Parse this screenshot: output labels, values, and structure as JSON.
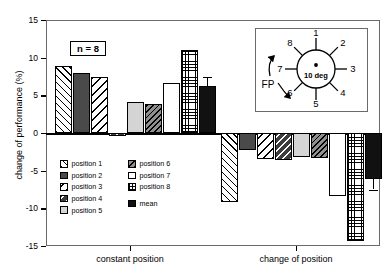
{
  "chart_data": {
    "type": "bar",
    "title": "",
    "xlabel": "",
    "ylabel": "change of performance (%)",
    "ylim": [
      -15,
      15
    ],
    "yticks": [
      15,
      10,
      5,
      0,
      -5,
      -10,
      -15
    ],
    "grid": false,
    "legend_position": "inside-lower-left",
    "annotation": "n = 8",
    "categories": [
      "constant position",
      "change of position"
    ],
    "series": [
      {
        "name": "position 1",
        "values": [
          8.9,
          -9.2
        ]
      },
      {
        "name": "position 2",
        "values": [
          7.9,
          -2.2
        ]
      },
      {
        "name": "position 3",
        "values": [
          7.4,
          -3.4
        ]
      },
      {
        "name": "position 4",
        "values": [
          -0.4,
          -3.6
        ]
      },
      {
        "name": "position 5",
        "values": [
          4.1,
          -3.2
        ]
      },
      {
        "name": "position 6",
        "values": [
          3.9,
          -3.3
        ]
      },
      {
        "name": "position 7",
        "values": [
          6.7,
          -8.4
        ]
      },
      {
        "name": "position 8",
        "values": [
          11.0,
          -14.3
        ]
      },
      {
        "name": "mean",
        "values": [
          6.2,
          -6.1
        ],
        "errors": [
          1.3,
          1.4
        ]
      }
    ]
  },
  "axes": {
    "ylabel": "change of performance (%)",
    "ytick_labels": [
      "15",
      "10",
      "5",
      "0",
      "-5",
      "-10",
      "-15"
    ],
    "xtick_labels": [
      "constant position",
      "change of position"
    ]
  },
  "annotation": {
    "n_label": "n = 8"
  },
  "legend": {
    "column_left": [
      {
        "label": "position 1",
        "pattern": "p1"
      },
      {
        "label": "position 2",
        "pattern": "p2"
      },
      {
        "label": "position 3",
        "pattern": "p3"
      },
      {
        "label": "position 4",
        "pattern": "p4"
      },
      {
        "label": "position 5",
        "pattern": "p5"
      }
    ],
    "column_right": [
      {
        "label": "position 6",
        "pattern": "p6"
      },
      {
        "label": "position 7",
        "pattern": "p7"
      },
      {
        "label": "position 8",
        "pattern": "p8"
      },
      {
        "label": "mean",
        "pattern": "pm"
      }
    ]
  },
  "inset": {
    "center_label": "10 deg",
    "fp_label": "FP",
    "spoke_labels": [
      "1",
      "2",
      "3",
      "4",
      "5",
      "6",
      "7",
      "8"
    ]
  },
  "colors": {
    "axis": "#6a6a6a",
    "zero_line": "#000000",
    "mean_fill": "#111111",
    "text": "#000000"
  }
}
